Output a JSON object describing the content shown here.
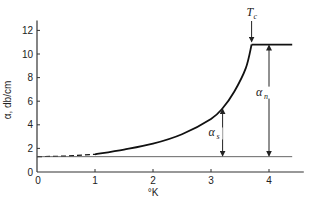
{
  "chart_data": {
    "type": "line",
    "title": "",
    "xlabel": "°K",
    "ylabel": "α, db/cm",
    "xlim": [
      0,
      4.6
    ],
    "ylim": [
      0,
      13
    ],
    "xticks": [
      0,
      1,
      2,
      3,
      4
    ],
    "yticks": [
      0,
      2,
      4,
      6,
      8,
      10,
      12
    ],
    "xtick_labels": [
      "0",
      "1",
      "2",
      "3",
      "4"
    ],
    "ytick_labels": [
      "0",
      "2",
      "4",
      "6",
      "8",
      "10",
      "12"
    ],
    "grid": false,
    "legend": null,
    "series": [
      {
        "name": "attenuation α (dashed extrapolation)",
        "style": "dashed",
        "x": [
          0,
          0.5,
          1.0
        ],
        "y": [
          1.3,
          1.35,
          1.5
        ]
      },
      {
        "name": "attenuation α (superconducting, α_s + residual)",
        "style": "solid",
        "x": [
          1.0,
          1.5,
          2.0,
          2.5,
          3.0,
          3.2,
          3.4,
          3.6,
          3.7
        ],
        "y": [
          1.5,
          1.9,
          2.4,
          3.2,
          4.5,
          5.4,
          6.8,
          8.8,
          10.8
        ]
      },
      {
        "name": "attenuation α (normal state plateau)",
        "style": "solid",
        "x": [
          3.7,
          4.4
        ],
        "y": [
          10.8,
          10.8
        ]
      },
      {
        "name": "residual baseline",
        "style": "thin",
        "x": [
          0,
          4.4
        ],
        "y": [
          1.3,
          1.3
        ]
      }
    ],
    "annotations": [
      {
        "text": "T_c",
        "x": 3.7,
        "y": 10.8,
        "type": "down-arrow",
        "label_main": "T",
        "label_sub": "c"
      },
      {
        "text": "α_s",
        "x": 3.2,
        "from_y": 1.3,
        "to_y": 5.4,
        "type": "double-arrow",
        "label_main": "α",
        "label_sub": "s"
      },
      {
        "text": "α_n",
        "x": 4.0,
        "from_y": 1.3,
        "to_y": 10.8,
        "type": "double-arrow",
        "label_main": "α",
        "label_sub": "n"
      }
    ]
  }
}
